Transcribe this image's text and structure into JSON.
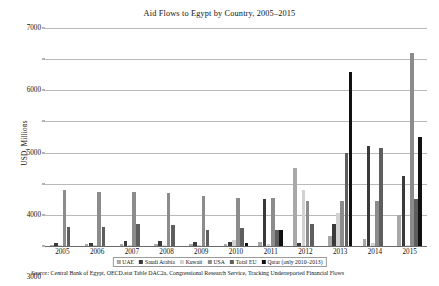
{
  "chart_data": {
    "type": "bar",
    "title": "Aid Flows to Egypt by Country, 2005–2015",
    "xlabel": "",
    "ylabel": "USD, Millions",
    "ylim": [
      0,
      7000
    ],
    "ytick_step": 1000,
    "yticks": [
      0,
      1000,
      2000,
      3000,
      4000,
      5000,
      6000,
      7000
    ],
    "ytick_labels": [
      "0",
      "1000",
      "2000",
      "3000",
      "4000",
      "5000",
      "6000",
      "7000"
    ],
    "grid": true,
    "legend_position": "bottom",
    "categories": [
      "2005",
      "2006",
      "2007",
      "2008",
      "2009",
      "2010",
      "2011",
      "2012",
      "2013",
      "2014",
      "2015"
    ],
    "series": [
      {
        "name": "UAE",
        "color": "#a8a8a8",
        "values": [
          40,
          50,
          60,
          70,
          55,
          60,
          140,
          2500,
          330,
          210,
          1000
        ]
      },
      {
        "name": "Saudi Arabia",
        "color": "#3a3a3a",
        "values": [
          90,
          110,
          150,
          170,
          120,
          130,
          1500,
          100,
          700,
          3200,
          2250
        ]
      },
      {
        "name": "Kuwait",
        "color": "#d2d2d2",
        "values": [
          30,
          35,
          40,
          45,
          40,
          180,
          60,
          1800,
          1050,
          90,
          30
        ]
      },
      {
        "name": "USA",
        "color": "#8c8c8c",
        "values": [
          1800,
          1750,
          1750,
          1700,
          1600,
          1550,
          1550,
          1450,
          1450,
          1450,
          6200
        ]
      },
      {
        "name": "Total EU",
        "color": "#5e5e5e",
        "values": [
          620,
          600,
          700,
          690,
          500,
          580,
          520,
          700,
          3000,
          3150,
          1500
        ]
      },
      {
        "name": "Qatar (only 2010–2013)",
        "color": "#111111",
        "values": [
          0,
          0,
          0,
          0,
          0,
          90,
          500,
          0,
          5600,
          0,
          3500
        ]
      }
    ]
  },
  "legend": {
    "items": [
      {
        "label": "UAE"
      },
      {
        "label": "Saudi Arabia"
      },
      {
        "label": "Kuwait"
      },
      {
        "label": "USA"
      },
      {
        "label": "Total EU"
      },
      {
        "label": "Qatar (only 2010–2013)"
      }
    ]
  },
  "source": {
    "prefix": "Source:",
    "text": " Central Bank of Egypt, OECD.stat Table DAC2a, Congressional Research Service, Tracking Underreported Financial Flows"
  }
}
